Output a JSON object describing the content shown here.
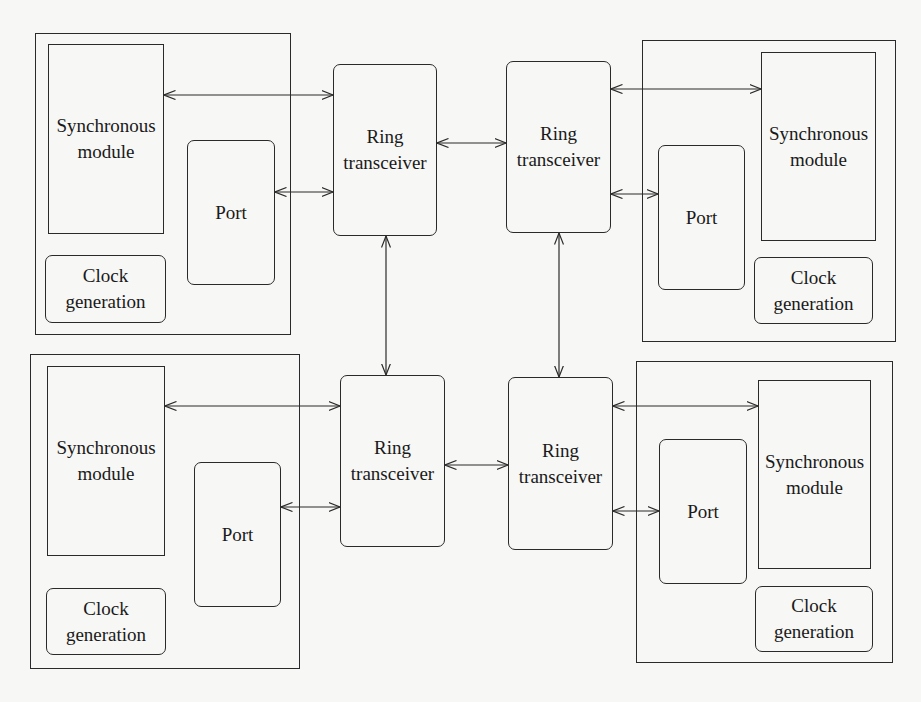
{
  "diagram": {
    "nodes": [
      {
        "id": "top-left",
        "synchronous_module": "Synchronous\nmodule",
        "port": "Port",
        "clock_generation": "Clock\ngeneration",
        "ring_transceiver": "Ring\ntransceiver"
      },
      {
        "id": "top-right",
        "synchronous_module": "Synchronous\nmodule",
        "port": "Port",
        "clock_generation": "Clock\ngeneration",
        "ring_transceiver": "Ring\ntransceiver"
      },
      {
        "id": "bottom-left",
        "synchronous_module": "Synchronous\nmodule",
        "port": "Port",
        "clock_generation": "Clock\ngeneration",
        "ring_transceiver": "Ring\ntransceiver"
      },
      {
        "id": "bottom-right",
        "synchronous_module": "Synchronous\nmodule",
        "port": "Port",
        "clock_generation": "Clock\ngeneration",
        "ring_transceiver": "Ring\ntransceiver"
      }
    ],
    "connections": [
      {
        "from": "top-left.synchronous_module",
        "to": "top-left.ring_transceiver",
        "type": "bidirectional"
      },
      {
        "from": "top-left.port",
        "to": "top-left.ring_transceiver",
        "type": "bidirectional"
      },
      {
        "from": "top-right.ring_transceiver",
        "to": "top-right.synchronous_module",
        "type": "bidirectional"
      },
      {
        "from": "top-right.ring_transceiver",
        "to": "top-right.port",
        "type": "bidirectional"
      },
      {
        "from": "bottom-left.synchronous_module",
        "to": "bottom-left.ring_transceiver",
        "type": "bidirectional"
      },
      {
        "from": "bottom-left.port",
        "to": "bottom-left.ring_transceiver",
        "type": "bidirectional"
      },
      {
        "from": "bottom-right.ring_transceiver",
        "to": "bottom-right.synchronous_module",
        "type": "bidirectional"
      },
      {
        "from": "bottom-right.ring_transceiver",
        "to": "bottom-right.port",
        "type": "bidirectional"
      },
      {
        "from": "top-left.ring_transceiver",
        "to": "top-right.ring_transceiver",
        "type": "bidirectional"
      },
      {
        "from": "top-left.ring_transceiver",
        "to": "bottom-left.ring_transceiver",
        "type": "bidirectional"
      },
      {
        "from": "top-right.ring_transceiver",
        "to": "bottom-right.ring_transceiver",
        "type": "bidirectional"
      },
      {
        "from": "bottom-left.ring_transceiver",
        "to": "bottom-right.ring_transceiver",
        "type": "bidirectional"
      }
    ]
  },
  "colors": {
    "line": "#2a2a2a",
    "background": "#f7f7f5"
  }
}
